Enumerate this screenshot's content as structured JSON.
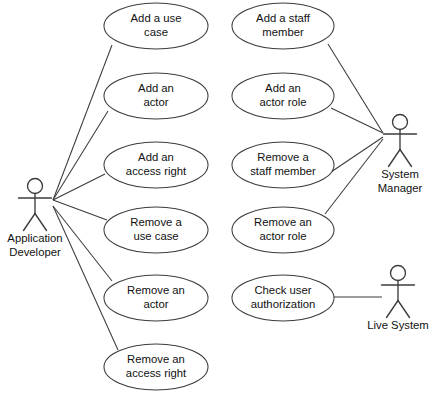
{
  "diagram": {
    "type": "uml-use-case-diagram",
    "canvas": {
      "width": 439,
      "height": 400,
      "background": "#ffffff"
    },
    "stroke_color": "#3c3c3c",
    "text_color": "#111111"
  },
  "actors": [
    {
      "id": "application-developer",
      "label_line1": "Application",
      "label_line2": "Developer",
      "x": 35,
      "y": 186
    },
    {
      "id": "system-manager",
      "label_line1": "System",
      "label_line2": "Manager",
      "x": 400,
      "y": 122
    },
    {
      "id": "live-system",
      "label_line1": "Live System",
      "label_line2": "",
      "x": 398,
      "y": 273
    }
  ],
  "use_cases": [
    {
      "id": "add-a-use-case",
      "line1": "Add a use",
      "line2": "case",
      "cx": 156,
      "cy": 26,
      "rx": 52,
      "ry": 23
    },
    {
      "id": "add-an-actor",
      "line1": "Add an",
      "line2": "actor",
      "cx": 156,
      "cy": 96,
      "rx": 52,
      "ry": 23
    },
    {
      "id": "add-an-access-right",
      "line1": "Add an",
      "line2": "access right",
      "cx": 156,
      "cy": 165,
      "rx": 52,
      "ry": 23
    },
    {
      "id": "remove-a-use-case",
      "line1": "Remove a",
      "line2": "use case",
      "cx": 156,
      "cy": 230,
      "rx": 52,
      "ry": 23
    },
    {
      "id": "remove-an-actor",
      "line1": "Remove an",
      "line2": "actor",
      "cx": 156,
      "cy": 298,
      "rx": 52,
      "ry": 23
    },
    {
      "id": "remove-an-access-right",
      "line1": "Remove an",
      "line2": "access right",
      "cx": 156,
      "cy": 367,
      "rx": 52,
      "ry": 23
    },
    {
      "id": "add-a-staff-member",
      "line1": "Add a staff",
      "line2": "member",
      "cx": 283,
      "cy": 26,
      "rx": 51,
      "ry": 23
    },
    {
      "id": "add-an-actor-role",
      "line1": "Add an",
      "line2": "actor role",
      "cx": 283,
      "cy": 96,
      "rx": 51,
      "ry": 23
    },
    {
      "id": "remove-a-staff-member",
      "line1": "Remove a",
      "line2": "staff member",
      "cx": 283,
      "cy": 165,
      "rx": 51,
      "ry": 23
    },
    {
      "id": "remove-an-actor-role",
      "line1": "Remove an",
      "line2": "actor role",
      "cx": 283,
      "cy": 230,
      "rx": 51,
      "ry": 23
    },
    {
      "id": "check-user-authorization",
      "line1": "Check user",
      "line2": "authorization",
      "cx": 283,
      "cy": 298,
      "rx": 51,
      "ry": 23
    }
  ],
  "associations": [
    {
      "id": "app-dev--add-a-use-case",
      "actor": "application-developer",
      "use_case": "add-a-use-case",
      "x1": 53,
      "y1": 200,
      "x2": 112,
      "y2": 45
    },
    {
      "id": "app-dev--add-an-actor",
      "actor": "application-developer",
      "use_case": "add-an-actor",
      "x1": 53,
      "y1": 200,
      "x2": 108,
      "y2": 111
    },
    {
      "id": "app-dev--add-an-access-right",
      "actor": "application-developer",
      "use_case": "add-an-access-right",
      "x1": 53,
      "y1": 200,
      "x2": 105,
      "y2": 174
    },
    {
      "id": "app-dev--remove-a-use-case",
      "actor": "application-developer",
      "use_case": "remove-a-use-case",
      "x1": 53,
      "y1": 200,
      "x2": 107,
      "y2": 220
    },
    {
      "id": "app-dev--remove-an-actor",
      "actor": "application-developer",
      "use_case": "remove-an-actor",
      "x1": 53,
      "y1": 206,
      "x2": 112,
      "y2": 281
    },
    {
      "id": "app-dev--remove-an-access-right",
      "actor": "application-developer",
      "use_case": "remove-an-access-right",
      "x1": 53,
      "y1": 206,
      "x2": 118,
      "y2": 350
    },
    {
      "id": "sys-mgr--add-a-staff-member",
      "actor": "system-manager",
      "use_case": "add-a-staff-member",
      "x1": 383,
      "y1": 133,
      "x2": 328,
      "y2": 44
    },
    {
      "id": "sys-mgr--add-an-actor-role",
      "actor": "system-manager",
      "use_case": "add-an-actor-role",
      "x1": 383,
      "y1": 133,
      "x2": 331,
      "y2": 108
    },
    {
      "id": "sys-mgr--remove-a-staff-member",
      "actor": "system-manager",
      "use_case": "remove-a-staff-member",
      "x1": 383,
      "y1": 137,
      "x2": 331,
      "y2": 172
    },
    {
      "id": "sys-mgr--remove-an-actor-role",
      "actor": "system-manager",
      "use_case": "remove-an-actor-role",
      "x1": 383,
      "y1": 139,
      "x2": 325,
      "y2": 214
    },
    {
      "id": "live-sys--check-user-auth",
      "actor": "live-system",
      "use_case": "check-user-authorization",
      "x1": 382,
      "y1": 297,
      "x2": 334,
      "y2": 297
    }
  ]
}
